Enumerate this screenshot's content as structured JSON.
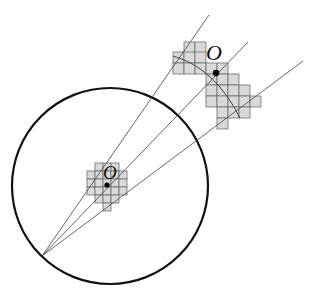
{
  "diagram": {
    "type": "geometric-projection",
    "circle": {
      "cx": 110,
      "cy": 186,
      "r": 98,
      "stroke": "#111111",
      "stroke_width": 2.2
    },
    "origin_point": {
      "x": 42,
      "y": 256
    },
    "rays": [
      {
        "x2": 209,
        "y2": 15
      },
      {
        "x2": 248,
        "y2": 42
      },
      {
        "x2": 303,
        "y2": 61
      }
    ],
    "small_grid": {
      "label": "O",
      "cell": 8,
      "point": {
        "x": 107,
        "y": 185
      },
      "label_pos": {
        "x": 103,
        "y": 179
      },
      "cells": [
        [
          95,
          163
        ],
        [
          103,
          163
        ],
        [
          111,
          163
        ],
        [
          87,
          171
        ],
        [
          95,
          171
        ],
        [
          103,
          171
        ],
        [
          111,
          171
        ],
        [
          119,
          171
        ],
        [
          87,
          179
        ],
        [
          95,
          179
        ],
        [
          103,
          179
        ],
        [
          111,
          179
        ],
        [
          119,
          179
        ],
        [
          87,
          187
        ],
        [
          95,
          187
        ],
        [
          103,
          187
        ],
        [
          111,
          187
        ],
        [
          119,
          187
        ],
        [
          95,
          195
        ],
        [
          103,
          195
        ],
        [
          111,
          195
        ],
        [
          103,
          203
        ]
      ]
    },
    "large_grid": {
      "label": "O",
      "cell": 11,
      "point": {
        "x": 216,
        "y": 73
      },
      "label_pos": {
        "x": 206,
        "y": 60
      },
      "cells": [
        [
          184,
          42
        ],
        [
          195,
          42
        ],
        [
          173,
          52
        ],
        [
          184,
          52
        ],
        [
          195,
          52
        ],
        [
          173,
          63
        ],
        [
          184,
          63
        ],
        [
          195,
          63
        ],
        [
          206,
          63
        ],
        [
          217,
          63
        ],
        [
          206,
          74
        ],
        [
          217,
          74
        ],
        [
          228,
          74
        ],
        [
          206,
          85
        ],
        [
          217,
          85
        ],
        [
          228,
          85
        ],
        [
          239,
          85
        ],
        [
          206,
          96
        ],
        [
          217,
          96
        ],
        [
          228,
          96
        ],
        [
          239,
          96
        ],
        [
          250,
          96
        ],
        [
          217,
          107
        ],
        [
          228,
          107
        ],
        [
          239,
          107
        ],
        [
          217,
          118
        ]
      ]
    },
    "arc": {
      "d": "M 173 56 Q 215 68 240 118"
    },
    "colors": {
      "cell_fill": "#d9d9d9",
      "cell_stroke": "#6e6e6e",
      "ray": "#555555",
      "dot": "#000000"
    }
  },
  "labels": {
    "small_o": "O",
    "large_o": "O"
  }
}
